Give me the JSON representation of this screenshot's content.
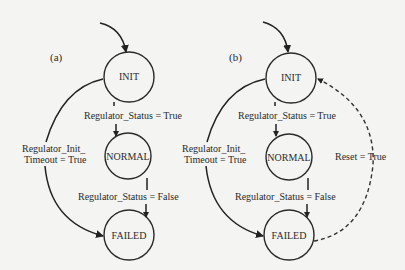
{
  "diagram_a": {
    "panel_label": "(a)",
    "states": {
      "init": "INIT",
      "normal": "NORMAL",
      "failed": "FAILED"
    },
    "transitions": {
      "init_to_normal": "Regulator_Status = True",
      "normal_to_failed": "Regulator_Status = False",
      "init_to_failed_line1": "Regulator_Init_",
      "init_to_failed_line2": "Timeout = True"
    }
  },
  "diagram_b": {
    "panel_label": "(b)",
    "states": {
      "init": "INIT",
      "normal": "NORMAL",
      "failed": "FAILED"
    },
    "transitions": {
      "init_to_normal": "Regulator_Status = True",
      "normal_to_failed": "Regulator_Status = False",
      "init_to_failed_line1": "Regulator_Init_",
      "init_to_failed_line2": "Timeout = True",
      "failed_to_init": "Reset = True"
    }
  }
}
